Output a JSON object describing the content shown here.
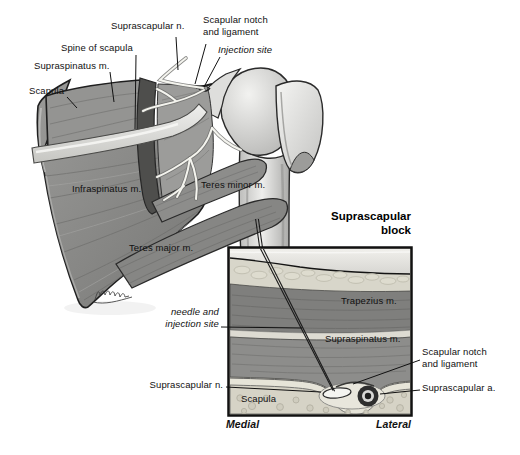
{
  "illustration": {
    "subject": "Suprascapular nerve block — posterior shoulder anatomy with cross-section inset"
  },
  "main_figure": {
    "labels": {
      "suprascapular_n": "Suprascapular n.",
      "scapular_notch_line1": "Scapular notch",
      "scapular_notch_line2": "and ligament",
      "injection_site": "Injection site",
      "spine_of_scapula": "Spine of scapula",
      "supraspinatus_m": "Supraspinatus m.",
      "scapula": "Scapula",
      "infraspinatus_m": "Infraspinatus m.",
      "teres_minor_m": "Teres minor m.",
      "teres_major_m": "Teres major m."
    }
  },
  "inset": {
    "title_line1": "Suprascapular",
    "title_line2": "block",
    "labels": {
      "needle_line1": "needle and",
      "needle_line2": "injection site",
      "suprascapular_n": "Suprascapular n.",
      "scapula": "Scapula",
      "trapezius_m": "Trapezius m.",
      "supraspinatus_m": "Supraspinatus m.",
      "scapular_notch_line1": "Scapular notch",
      "scapular_notch_line2": "and ligament",
      "suprascapular_a": "Suprascapular a.",
      "medial": "Medial",
      "lateral": "Lateral"
    }
  },
  "colors": {
    "background": "#ffffff",
    "outline": "#1a1a1a",
    "muscle": "#8a8a8a",
    "muscle_shadow": "#6f6f6f",
    "bone_highlight": "#e9e9e7",
    "nerve": "#f4f4ee",
    "fat": "#d8d6ca",
    "inset_bone": "#d6d3c6",
    "artery": "#2e2e2e"
  }
}
